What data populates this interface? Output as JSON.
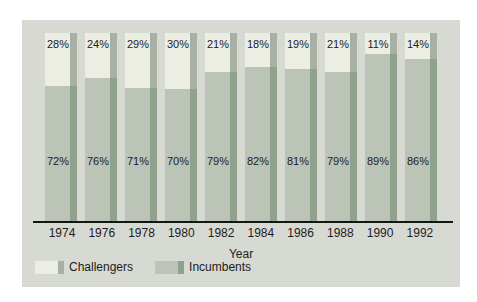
{
  "chart_data": {
    "type": "bar",
    "stacked": true,
    "orientation": "vertical",
    "categories": [
      "1974",
      "1976",
      "1978",
      "1980",
      "1982",
      "1984",
      "1986",
      "1988",
      "1990",
      "1992"
    ],
    "series": [
      {
        "name": "Challengers",
        "values": [
          28,
          24,
          29,
          30,
          21,
          18,
          19,
          21,
          11,
          14
        ],
        "fill_color": "#eceee4",
        "stripe_color": "#a7b0a3"
      },
      {
        "name": "Incumbents",
        "values": [
          72,
          76,
          71,
          70,
          79,
          82,
          81,
          79,
          89,
          86
        ],
        "fill_color": "#bbc4b7",
        "stripe_color": "#8fa28b"
      }
    ],
    "title": "",
    "xlabel": "Year",
    "ylabel": "",
    "ylim": [
      0,
      100
    ],
    "grid": false,
    "legend_position": "bottom-left",
    "value_label_suffix": "%",
    "data_labels": true
  },
  "colors": {
    "page_background": "#ffffff",
    "panel_background": "#d7dad3",
    "axis_line": "#151515",
    "label_text": "#1c1c1c"
  }
}
